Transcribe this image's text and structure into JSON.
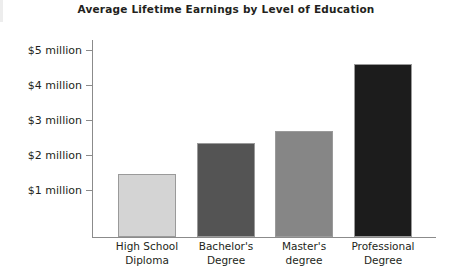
{
  "chart_data": {
    "type": "bar",
    "title": "Average Lifetime Earnings by Level of Education",
    "xlabel": "",
    "ylabel": "",
    "categories": [
      "High School Diploma",
      "Bachelor's Degree",
      "Master's degree",
      "Professional Degree"
    ],
    "category_lines": [
      [
        "High School",
        "Diploma"
      ],
      [
        "Bachelor's",
        "Degree"
      ],
      [
        "Master's",
        "degree"
      ],
      [
        "Professional",
        "Degree"
      ]
    ],
    "values": [
      1.45,
      2.35,
      2.7,
      4.6
    ],
    "value_unit": "million USD",
    "ylim": [
      0,
      5.35
    ],
    "yticks": [
      1,
      2,
      3,
      4,
      5
    ],
    "ytick_labels": [
      "$1 million",
      "$2 million",
      "$3 million",
      "$4 million",
      "$5 million"
    ],
    "grid": false,
    "legend": null,
    "bar_colors": [
      "#d4d4d4",
      "#545454",
      "#868686",
      "#1c1c1c"
    ],
    "axis_color": "#8b8b8b",
    "bar_border_color": "#9a9a9a"
  }
}
